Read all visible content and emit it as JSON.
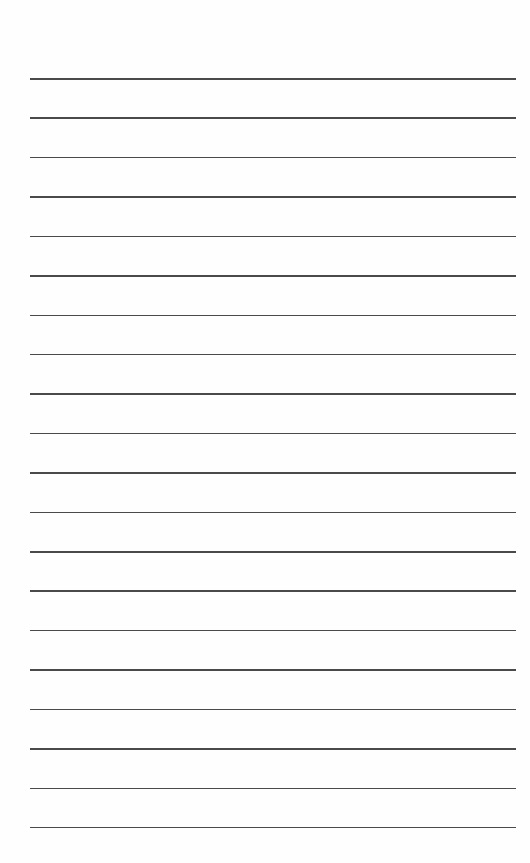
{
  "page": {
    "type": "lined-paper",
    "line_count": 20,
    "first_line_y": 78,
    "line_spacing": 39.42,
    "line_left": 30,
    "line_width": 486,
    "line_color": "#4a4a4a",
    "background": "#fefefe"
  }
}
